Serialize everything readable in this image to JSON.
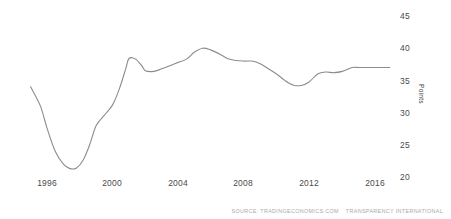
{
  "chart_data": {
    "type": "line",
    "title": "",
    "subtitle": "",
    "xlabel": "",
    "ylabel": "Points",
    "xlim": [
      1995,
      2016.9
    ],
    "ylim": [
      20,
      45
    ],
    "grid": false,
    "legend": null,
    "x_ticks": [
      "1996",
      "2000",
      "2004",
      "2008",
      "2012",
      "2016"
    ],
    "x_tick_values": [
      1996,
      2000,
      2004,
      2008,
      2012,
      2016
    ],
    "y_ticks": [
      "20",
      "25",
      "30",
      "35",
      "40",
      "45"
    ],
    "y_tick_values": [
      20,
      25,
      30,
      35,
      40,
      45
    ],
    "series": [
      {
        "name": "Corruption Index",
        "color": "#8c8c8c",
        "x": [
          1995,
          1995.6,
          1996,
          1996.5,
          1997,
          1997.4,
          1997.8,
          1998.2,
          1998.6,
          1999,
          1999.5,
          2000,
          2000.4,
          2000.8,
          2001,
          2001.4,
          2001.8,
          2002,
          2002.5,
          2003,
          2003.6,
          2004,
          2004.5,
          2005,
          2005.5,
          2006,
          2006.6,
          2007,
          2007.5,
          2008,
          2008.5,
          2009,
          2009.5,
          2010,
          2010.5,
          2011,
          2011.5,
          2012,
          2012.5,
          2013,
          2013.5,
          2014,
          2014.6,
          2015,
          2015.6,
          2016,
          2016.9
        ],
        "values": [
          34.0,
          31.0,
          27.6,
          24.0,
          22.0,
          21.3,
          21.4,
          22.6,
          25.0,
          28.0,
          29.6,
          31.2,
          33.6,
          36.8,
          38.4,
          38.3,
          37.2,
          36.5,
          36.4,
          36.8,
          37.4,
          37.8,
          38.3,
          39.4,
          40.0,
          39.7,
          39.0,
          38.4,
          38.1,
          38.0,
          38.0,
          37.6,
          36.8,
          36.0,
          35.0,
          34.3,
          34.2,
          34.8,
          36.0,
          36.3,
          36.2,
          36.4,
          37.0,
          37.0,
          37.0,
          37.0,
          37.0
        ]
      }
    ]
  },
  "axis": {
    "y_title": "Points"
  },
  "footer": {
    "source_prefix": "SOURCE: TRADINGECONOMICS.COM",
    "source_attribution": "TRANSPARENCY INTERNATIONAL"
  }
}
